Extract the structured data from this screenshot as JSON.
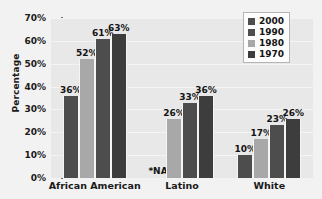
{
  "chart_data": {
    "type": "bar",
    "title": "",
    "xlabel": "",
    "ylabel": "Percentage",
    "ylim": [
      0,
      70
    ],
    "ytick_labels": [
      "0%",
      "10%",
      "20%",
      "30%",
      "40%",
      "50%",
      "60%",
      "70%"
    ],
    "ytick_values": [
      0,
      10,
      20,
      30,
      40,
      50,
      60,
      70
    ],
    "grid": true,
    "legend_position": "top-right",
    "categories": [
      "African American",
      "Latino",
      "White"
    ],
    "series": [
      {
        "name": "2000",
        "color": "#4d4d4d",
        "values": [
          36,
          null,
          10
        ],
        "labels": [
          "36%",
          "*NA",
          "10%"
        ]
      },
      {
        "name": "1990",
        "color": "#a8a8a8",
        "values": [
          52,
          26,
          17
        ],
        "labels": [
          "52%",
          "26%",
          "17%"
        ]
      },
      {
        "name": "1980",
        "color": "#4d4d4d",
        "values": [
          61,
          33,
          23
        ],
        "labels": [
          "61%",
          "33%",
          "23%"
        ]
      },
      {
        "name": "1970",
        "color": "#3d3d3d",
        "values": [
          63,
          36,
          26
        ],
        "labels": [
          "63%",
          "36%",
          "26%"
        ]
      }
    ],
    "legend_entries": [
      {
        "label": "2000",
        "color": "#4d4d4d"
      },
      {
        "label": "1990",
        "color": "#4d4d4d"
      },
      {
        "label": "1980",
        "color": "#a8a8a8"
      },
      {
        "label": "1970",
        "color": "#3d3d3d"
      }
    ],
    "na_marker": "*NA",
    "colors": {
      "plot_background": "#e8e8e8",
      "figure_background": "#f2f2f2",
      "gridline": "#f4f4f4",
      "text": "#1a1a1a",
      "bar_dark": "#4d4d4d",
      "bar_light": "#a8a8a8"
    }
  }
}
